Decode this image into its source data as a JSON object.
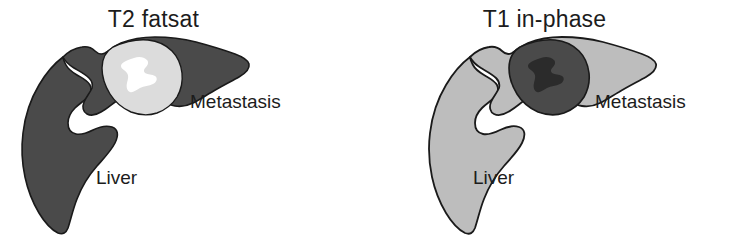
{
  "figure": {
    "background_color": "#ffffff",
    "width": 734,
    "height": 241,
    "kind": "medical-illustration-pair"
  },
  "panels": [
    {
      "id": "t2-fatsat",
      "title": "T2 fatsat",
      "liver": {
        "label": "Liver",
        "fill": "#4a4a4a",
        "stroke": "#1a1a1a",
        "signal": "hypointense"
      },
      "lesion": {
        "label": "Metastasis",
        "fill": "#dcdcdc",
        "stroke": "#1a1a1a",
        "core_fill": "#ffffff",
        "signal": "hyperintense"
      }
    },
    {
      "id": "t1-in-phase",
      "title": "T1 in-phase",
      "liver": {
        "label": "Liver",
        "fill": "#bdbdbd",
        "stroke": "#1a1a1a",
        "signal": "hyperintense"
      },
      "lesion": {
        "label": "Metastasis",
        "fill": "#4a4a4a",
        "stroke": "#1a1a1a",
        "core_fill": "#2b2b2b",
        "signal": "hypointense"
      }
    }
  ]
}
